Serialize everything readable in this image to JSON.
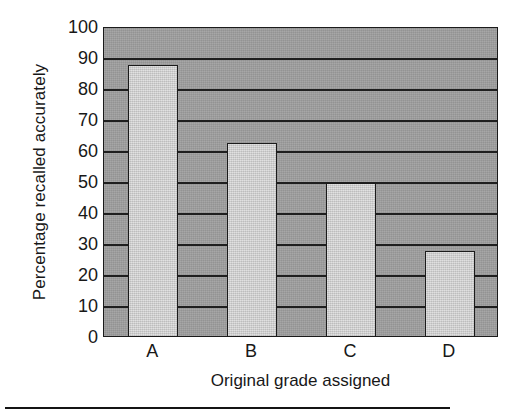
{
  "chart_data": {
    "type": "bar",
    "title": "",
    "categories": [
      "A",
      "B",
      "C",
      "D"
    ],
    "values": [
      88,
      63,
      50,
      28
    ],
    "xlabel": "Original grade assigned",
    "ylabel": "Percentage recalled accurately",
    "ylim": [
      0,
      100
    ],
    "ytick_labels": [
      "0",
      "10",
      "20",
      "30",
      "40",
      "50",
      "60",
      "70",
      "80",
      "90",
      "100"
    ],
    "ytick_values": [
      0,
      10,
      20,
      30,
      40,
      50,
      60,
      70,
      80,
      90,
      100
    ],
    "grid": "horizontal",
    "legend": "none",
    "colors": {
      "plot_background": "#9d9d9d",
      "bar_fill": "#cfcfcf",
      "bar_edge": "#1b1b1b",
      "gridline": "#1f1f1f",
      "text": "#181818",
      "page_background": "#ffffff"
    }
  },
  "figure": {
    "bottom_rule_present": true
  }
}
